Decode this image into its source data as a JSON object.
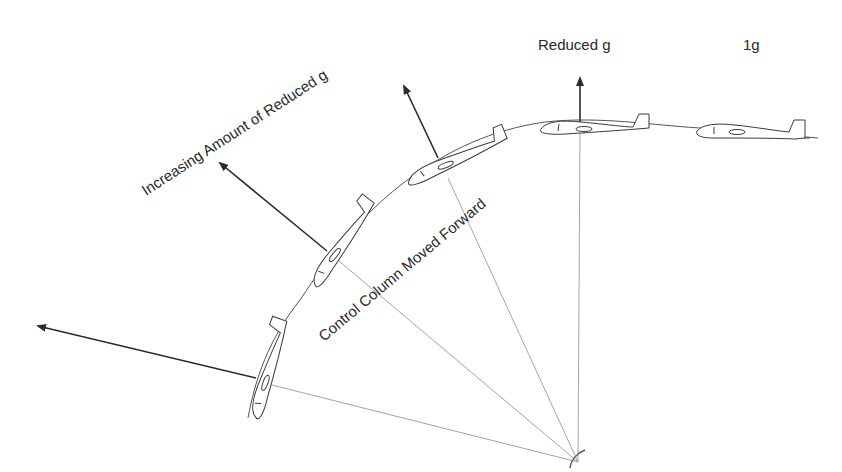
{
  "diagram": {
    "labels": {
      "increasing": "Increasing Amount of Reduced g",
      "reduced": "Reduced g",
      "one_g": "1g",
      "control": "Control Column Moved Forward"
    },
    "elements": {
      "gliders": [
        {
          "id": "glider-1",
          "attitude": "steep nose-down",
          "force_arrow": "large, pointing left"
        },
        {
          "id": "glider-2",
          "attitude": "nose-down",
          "force_arrow": "pointing up-left"
        },
        {
          "id": "glider-3",
          "attitude": "slight nose-down",
          "force_arrow": "pointing up-left, shorter"
        },
        {
          "id": "glider-4",
          "attitude": "level top of arc",
          "force_arrow": "short, vertical up",
          "label": "Reduced g"
        },
        {
          "id": "glider-5",
          "attitude": "level flight",
          "label": "1g"
        }
      ],
      "pivot": "center of curvature with radius lines to each glider"
    },
    "colors": {
      "line": "#3a3a3a",
      "radius": "#9a9a9a",
      "text": "#2a2a2a",
      "background": "#ffffff"
    }
  }
}
